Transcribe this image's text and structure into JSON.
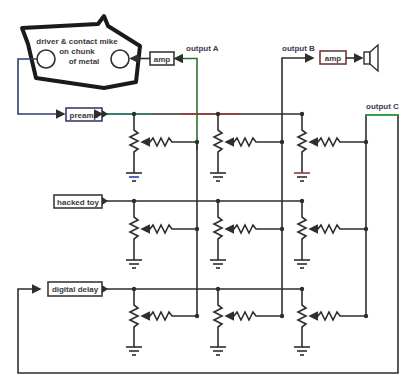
{
  "diagram": {
    "title": "",
    "transducer": {
      "label_lines": [
        "driver & contact mike",
        "on chunk",
        "of metal"
      ]
    },
    "blocks": {
      "amp_a": "amp",
      "amp_b": "amp",
      "preamp": "preamp",
      "hacked_toy": "hacked toy",
      "digital_delay": "digital delay"
    },
    "outputs": {
      "a": "output A",
      "b": "output B",
      "c": "output C"
    },
    "inputs": [
      "preamp",
      "hacked toy",
      "digital delay"
    ],
    "matrix": {
      "rows": 3,
      "cols": 3,
      "element": "potentiometer + series resistor to output bus",
      "ground_per_pot": true
    },
    "colors": {
      "wire": "#2e2e2e",
      "outline": "#1a1a1a",
      "accent_red": "#b03030",
      "accent_green": "#30b040",
      "accent_blue": "#3040b0"
    }
  }
}
